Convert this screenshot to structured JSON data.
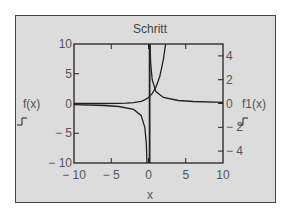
{
  "chart_data": {
    "type": "line",
    "title": "Schritt",
    "xlabel": "x",
    "ylabel_left": "f(x)",
    "ylabel_right": "f1(x)",
    "xlim": [
      -10,
      10
    ],
    "ylim_left": [
      -10,
      10
    ],
    "ylim_right": [
      -5,
      5
    ],
    "x_ticks": [
      "-10",
      "-5",
      "0",
      "5",
      "10"
    ],
    "y_ticks_left": [
      "10",
      "5",
      "0",
      "-5",
      "-10"
    ],
    "y_ticks_right": [
      "4",
      "2",
      "0",
      "-2",
      "-4"
    ],
    "grid": false,
    "legend": "none",
    "series": [
      {
        "name": "f(x)",
        "axis": "left",
        "x": [
          -10,
          -6,
          -4,
          -3,
          -2,
          -1,
          -0.5,
          0,
          0.5,
          1,
          1.5,
          2,
          2.3
        ],
        "values": [
          0.0,
          0.002,
          0.018,
          0.05,
          0.135,
          0.368,
          0.607,
          1.0,
          1.65,
          2.72,
          4.48,
          7.39,
          9.97
        ]
      },
      {
        "name": "f1(x) (x<0)",
        "axis": "right",
        "x": [
          -10,
          -6,
          -4,
          -2,
          -1,
          -0.5,
          -0.3,
          -0.2
        ],
        "values": [
          -0.1,
          -0.167,
          -0.25,
          -0.5,
          -1.0,
          -2.0,
          -3.33,
          -5.0
        ]
      },
      {
        "name": "f1(x) (x>0)",
        "axis": "right",
        "x": [
          0.2,
          0.3,
          0.5,
          1,
          2,
          4,
          6,
          10
        ],
        "values": [
          5.0,
          3.33,
          2.0,
          1.0,
          0.5,
          0.25,
          0.167,
          0.1
        ]
      }
    ]
  },
  "labels": {
    "title": "Schritt",
    "xlabel": "x",
    "left_axis": "f(x)",
    "right_axis": "f1(x)"
  },
  "colors": {
    "frame_bg": "#dcdcdc",
    "line": "#222222",
    "text": "#555555"
  }
}
